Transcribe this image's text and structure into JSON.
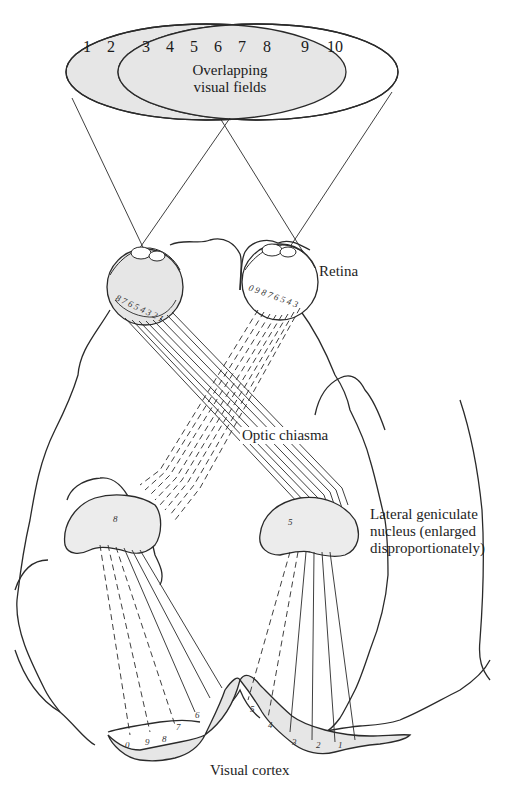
{
  "figure": {
    "type": "anatomical-diagram",
    "colors": {
      "line": "#2a2a2a",
      "shade": "#e6e6e6",
      "background": "#ffffff"
    }
  },
  "visual_fields": {
    "numbers": [
      "1",
      "2",
      "3",
      "4",
      "5",
      "6",
      "7",
      "8",
      "9",
      "10"
    ],
    "overlap_label_line1": "Overlapping",
    "overlap_label_line2": "visual fields"
  },
  "retina": {
    "left_eye_numbers": "87654321",
    "right_eye_numbers": "0987654 3",
    "label": "Retina"
  },
  "labels": {
    "retina": "Retina",
    "optic_chiasma": "Optic chiasma",
    "lgn_line1": "Lateral geniculate",
    "lgn_line2": "nucleus (enlarged",
    "lgn_line3": "disproportionately)",
    "visual_cortex": "Visual cortex"
  },
  "cortex": {
    "left_numbers": [
      "0",
      "9",
      "8",
      "7",
      "6"
    ],
    "right_numbers": [
      "5",
      "4",
      "3",
      "2",
      "1"
    ]
  },
  "lgn_marks": {
    "left": "8",
    "right": "5"
  }
}
